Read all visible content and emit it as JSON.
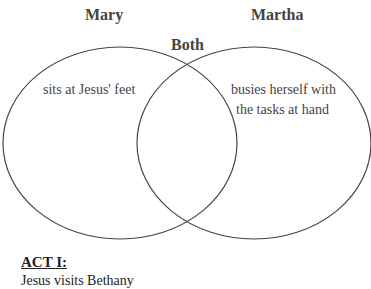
{
  "diagram": {
    "type": "venn",
    "left": {
      "label": "Mary",
      "items": [
        "sits at Jesus' feet"
      ]
    },
    "right": {
      "label": "Martha",
      "items": [
        "busies herself with the tasks at hand"
      ]
    },
    "overlap": {
      "label": "Both",
      "items": []
    }
  },
  "labels": {
    "mary": "Mary",
    "martha": "Martha",
    "both": "Both",
    "mary_item": "sits at Jesus' feet",
    "martha_item_line1": "busies herself with",
    "martha_item_line2": "the tasks at hand"
  },
  "section": {
    "heading": "ACT I:",
    "cutoff_text": "Jesus visits Bethany"
  }
}
